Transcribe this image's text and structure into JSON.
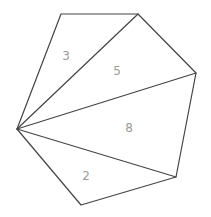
{
  "diagram": {
    "type": "triangulated-polygon",
    "stroke_color": "#444444",
    "label_color": "#9a9a9a",
    "vertices": {
      "hub": [
        17,
        129
      ],
      "top_left": [
        61,
        14
      ],
      "top_right": [
        138,
        14
      ],
      "right": [
        196,
        73
      ],
      "lower_right": [
        176,
        177
      ],
      "bottom": [
        81,
        205
      ]
    },
    "regions": [
      {
        "id": "region-3",
        "label": "3",
        "position": [
          66,
          56
        ]
      },
      {
        "id": "region-5",
        "label": "5",
        "position": [
          117,
          71
        ]
      },
      {
        "id": "region-8",
        "label": "8",
        "position": [
          129,
          128
        ]
      },
      {
        "id": "region-2",
        "label": "2",
        "position": [
          86,
          176
        ]
      }
    ]
  }
}
